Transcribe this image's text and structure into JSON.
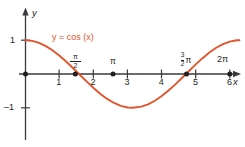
{
  "figure": {
    "kind": "cartesian-plot",
    "background": "#ffffff",
    "curve_color": "#e2542c",
    "axis_color": "#3b3b3f",
    "text_color": "#231f20"
  },
  "axes": {
    "x_axis_name": "x",
    "y_axis_name": "y",
    "x_tick_labels": [
      "1",
      "2",
      "3",
      "4",
      "5",
      "6"
    ],
    "x_tick_values": [
      1,
      2,
      3,
      4,
      5,
      6
    ],
    "y_tick_labels": [
      "1",
      "–1"
    ],
    "y_tick_values": [
      1,
      -1
    ],
    "xlim": [
      -0.2,
      6.45
    ],
    "ylim": [
      -1.45,
      1.35
    ],
    "grid": false,
    "special_labels": [
      {
        "name": "pi-over-2",
        "numerator": "π",
        "denominator": "2",
        "x_value": 1.5708
      },
      {
        "name": "pi",
        "text": "π",
        "x_value": 3.1416
      },
      {
        "name": "three-pi-over-2",
        "numerator": "3",
        "denominator": "2",
        "pi": "π",
        "x_value": 4.7124
      },
      {
        "name": "two-pi",
        "text": "2π",
        "x_value": 6.2832
      }
    ],
    "marked_points": [
      {
        "name": "origin-point",
        "x": 0,
        "y": 0
      },
      {
        "name": "zero-at-pi-over-2",
        "x": 1.5708,
        "y": 0
      },
      {
        "name": "point-at-pi",
        "x": 3.1416,
        "y": 0
      },
      {
        "name": "zero-at-three-pi-over-2",
        "x": 4.7124,
        "y": 0
      },
      {
        "name": "point-at-two-pi",
        "x": 6.2832,
        "y": 0
      }
    ]
  },
  "chart_data": {
    "type": "line",
    "title": "",
    "subtitle": "",
    "xlabel": "x",
    "ylabel": "y",
    "xlim": [
      -0.2,
      6.45
    ],
    "ylim": [
      -1.45,
      1.35
    ],
    "grid": false,
    "legend_position": "inline-annotation",
    "annotations": [
      {
        "name": "curve-equation-label",
        "text": "y = cos (x)",
        "x_value": 0.95,
        "y_value": 0.95,
        "color": "#e2542c"
      }
    ],
    "xticks": [
      1,
      2,
      3,
      4,
      5,
      6
    ],
    "xticklabels": [
      "1",
      "2",
      "3",
      "4",
      "5",
      "6"
    ],
    "yticks": [
      1,
      -1
    ],
    "yticklabels": [
      "1",
      "–1"
    ],
    "series": [
      {
        "name": "y = cos (x)",
        "color": "#e2542c",
        "equation": "y = cos(x)",
        "x": [
          0,
          0.2,
          0.4,
          0.6,
          0.8,
          1.0,
          1.2,
          1.4,
          1.5708,
          1.8,
          2.0,
          2.2,
          2.4,
          2.6,
          2.8,
          3.0,
          3.1416,
          3.4,
          3.6,
          3.8,
          4.0,
          4.2,
          4.4,
          4.6,
          4.7124,
          5.0,
          5.2,
          5.4,
          5.6,
          5.8,
          6.0,
          6.2,
          6.2832
        ],
        "values": [
          1.0,
          0.98,
          0.921,
          0.825,
          0.697,
          0.54,
          0.362,
          0.17,
          0.0,
          -0.227,
          -0.416,
          -0.589,
          -0.737,
          -0.857,
          -0.942,
          -0.99,
          -1.0,
          -0.967,
          -0.897,
          -0.791,
          -0.654,
          -0.49,
          -0.307,
          -0.112,
          0.0,
          0.284,
          0.469,
          0.635,
          0.776,
          0.886,
          0.96,
          0.997,
          1.0
        ]
      }
    ],
    "key_points": {
      "maxima": [
        {
          "x": 0,
          "y": 1
        },
        {
          "x": 6.2832,
          "y": 1
        }
      ],
      "minima": [
        {
          "x": 3.1416,
          "y": -1
        }
      ],
      "zeros": [
        {
          "x": 1.5708,
          "y": 0
        },
        {
          "x": 4.7124,
          "y": 0
        }
      ]
    }
  }
}
